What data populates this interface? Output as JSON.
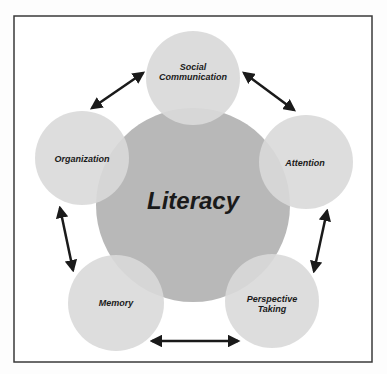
{
  "diagram": {
    "center": {
      "label": "Literacy",
      "color": "#b8b8b8"
    },
    "nodes": [
      {
        "id": "social",
        "lines": [
          "Social",
          "Communication"
        ]
      },
      {
        "id": "attention",
        "lines": [
          "Attention"
        ]
      },
      {
        "id": "perspective",
        "lines": [
          "Perspective",
          "Taking"
        ]
      },
      {
        "id": "memory",
        "lines": [
          "Memory"
        ]
      },
      {
        "id": "organization",
        "lines": [
          "Organization"
        ]
      }
    ],
    "node_color": "#d9d9d9",
    "arrow_color": "#1a1a1a",
    "connections": [
      [
        "organization",
        "social"
      ],
      [
        "social",
        "attention"
      ],
      [
        "attention",
        "perspective"
      ],
      [
        "perspective",
        "memory"
      ],
      [
        "memory",
        "organization"
      ]
    ]
  }
}
